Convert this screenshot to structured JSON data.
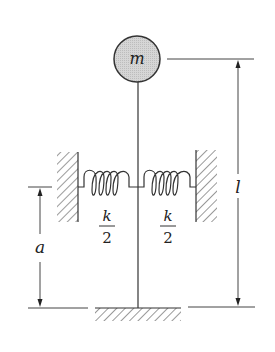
{
  "diagram": {
    "type": "mechanical-schematic",
    "mass": {
      "label": "m",
      "fill": "#d4d4d4"
    },
    "springs": [
      {
        "id": "left",
        "label_num": "k",
        "label_den": "2"
      },
      {
        "id": "right",
        "label_num": "k",
        "label_den": "2"
      }
    ],
    "dimensions": [
      {
        "id": "spring-height",
        "label": "a"
      },
      {
        "id": "rod-length",
        "label": "l"
      }
    ],
    "colors": {
      "line": "#333333",
      "hatch": "#555555",
      "mass_fill": "#d4d4d4"
    }
  }
}
